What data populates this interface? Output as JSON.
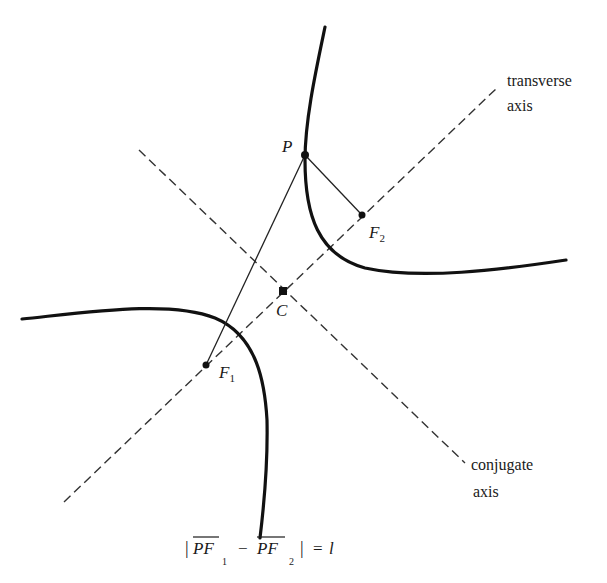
{
  "diagram": {
    "type": "hyperbola",
    "colors": {
      "curve": "#111111",
      "line": "#222222",
      "axis": "#333333",
      "background": "#ffffff"
    },
    "points": {
      "P": {
        "label": "P",
        "x": 305,
        "y": 155
      },
      "F1": {
        "label": "F",
        "sub": "1",
        "x": 206,
        "y": 365
      },
      "F2": {
        "label": "F",
        "sub": "2",
        "x": 362,
        "y": 215
      },
      "C": {
        "label": "C",
        "x": 283,
        "y": 291
      }
    },
    "axes": {
      "transverse": {
        "label_line1": "transverse",
        "label_line2": "axis"
      },
      "conjugate": {
        "label_line1": "conjugate",
        "label_line2": "axis"
      }
    },
    "formula": {
      "bar_left": "|",
      "term1": "PF",
      "sub1": "1",
      "minus": "−",
      "term2": "PF",
      "sub2": "2",
      "bar_right": "|",
      "equals": "=",
      "rhs": "l"
    }
  }
}
